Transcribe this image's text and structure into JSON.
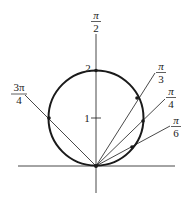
{
  "figure": {
    "curve": "r = 2 sin θ",
    "axis_labels": {
      "polar_axis_top": {
        "num": "π",
        "den": "2"
      }
    },
    "radial_ticks": [
      {
        "label": "1",
        "value": 1
      },
      {
        "label": "2",
        "value": 2
      }
    ],
    "rays": [
      {
        "name": "3pi-over-4",
        "num": "3π",
        "den": "4",
        "angle_deg": 135
      },
      {
        "name": "pi-over-3",
        "num": "π",
        "den": "3",
        "angle_deg": 60
      },
      {
        "name": "pi-over-4",
        "num": "π",
        "den": "4",
        "angle_deg": 45
      },
      {
        "name": "pi-over-6",
        "num": "π",
        "den": "6",
        "angle_deg": 30
      }
    ],
    "colors": {
      "stroke": "#1a1a1a",
      "background": "#ffffff"
    }
  }
}
